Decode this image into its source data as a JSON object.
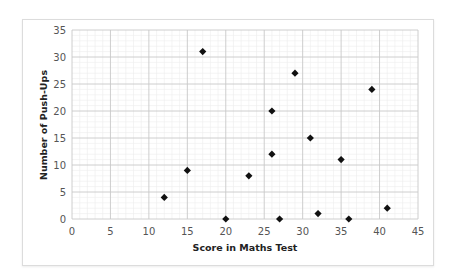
{
  "chart_data": {
    "type": "scatter",
    "title": "",
    "xlabel": "Score in Maths Test",
    "ylabel": "Number of Push-Ups",
    "xlim": [
      0,
      45
    ],
    "ylim": [
      0,
      35
    ],
    "x_ticks": [
      0,
      5,
      10,
      15,
      20,
      25,
      30,
      35,
      40,
      45
    ],
    "y_ticks": [
      0,
      5,
      10,
      15,
      20,
      25,
      30,
      35
    ],
    "grid": {
      "major_step": 5,
      "minor_step": 1
    },
    "marker": "diamond",
    "marker_color": "#111111",
    "legend": null,
    "points": [
      {
        "x": 12,
        "y": 4
      },
      {
        "x": 15,
        "y": 9
      },
      {
        "x": 17,
        "y": 31
      },
      {
        "x": 20,
        "y": 0
      },
      {
        "x": 23,
        "y": 8
      },
      {
        "x": 26,
        "y": 20
      },
      {
        "x": 26,
        "y": 12
      },
      {
        "x": 27,
        "y": 0
      },
      {
        "x": 29,
        "y": 27
      },
      {
        "x": 31,
        "y": 15
      },
      {
        "x": 32,
        "y": 1
      },
      {
        "x": 35,
        "y": 11
      },
      {
        "x": 36,
        "y": 0
      },
      {
        "x": 39,
        "y": 24
      },
      {
        "x": 41,
        "y": 2
      }
    ]
  },
  "colors": {
    "minor_grid": "#ececec",
    "major_grid": "#c8c8c8",
    "tick_text": "#555555",
    "title_text": "#222222"
  }
}
